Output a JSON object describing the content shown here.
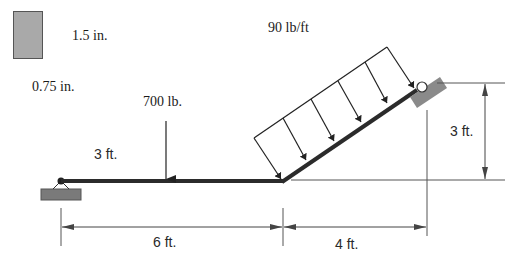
{
  "cross_section": {
    "height_label": "1.5 in.",
    "width_label": "0.75 in.",
    "fill_color": "#a9a9a9"
  },
  "loads": {
    "point_load_label": "700 lb.",
    "distributed_load_label": "90 lb/ft",
    "point_load_distance_label": "3 ft."
  },
  "dimensions": {
    "horizontal_span_label": "6 ft.",
    "inclined_run_label": "4 ft.",
    "inclined_rise_label": "3 ft."
  },
  "supports": {
    "left": "pin-support",
    "right": "roller-support"
  },
  "colors": {
    "beam": "#2b2b2b",
    "support_fill": "#7a7a7a",
    "dimension_line": "#555555"
  }
}
